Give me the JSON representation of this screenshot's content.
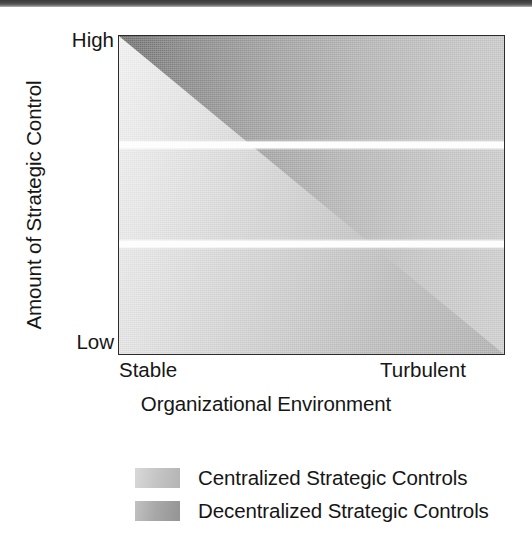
{
  "chart_data": {
    "type": "area",
    "title": "",
    "xlabel": "Organizational Environment",
    "ylabel": "Amount of Strategic Control",
    "x_ticks": [
      "Stable",
      "Turbulent"
    ],
    "y_ticks": [
      "High",
      "Low"
    ],
    "xlim": [
      "Stable",
      "Turbulent"
    ],
    "ylim": [
      "Low",
      "High"
    ],
    "grid": false,
    "legend_position": "bottom",
    "series": [
      {
        "name": "Centralized Strategic Controls",
        "region": "lower-left-triangle",
        "polygon": [
          [
            0,
            1
          ],
          [
            1,
            0
          ],
          [
            0,
            0
          ]
        ],
        "gradient_from": "#f2f2f2",
        "gradient_to": "#b0b0b0",
        "note": "Dominant when environment is Stable and strategic control is High"
      },
      {
        "name": "Decentralized Strategic Controls",
        "region": "upper-right-triangle",
        "polygon": [
          [
            0,
            1
          ],
          [
            1,
            1
          ],
          [
            1,
            0
          ]
        ],
        "gradient_from": "#6e6e6e",
        "gradient_to": "#cfcfcf",
        "note": "Dominant when environment is Turbulent and strategic control is Low"
      }
    ],
    "dividers": [
      {
        "type": "horizontal-white-band",
        "y_fraction": 0.33
      },
      {
        "type": "horizontal-white-band",
        "y_fraction": 0.64
      }
    ],
    "colors": {
      "axis_border": "#2b2b2b",
      "text": "#161616",
      "band_separator": "#fdfdfd",
      "background": "#ffffff"
    }
  },
  "axes": {
    "y_title": "Amount of Strategic Control",
    "y_tick_high": "High",
    "y_tick_low": "Low",
    "x_title": "Organizational Environment",
    "x_tick_left": "Stable",
    "x_tick_right": "Turbulent"
  },
  "legend": {
    "items": [
      {
        "label": "Centralized Strategic Controls",
        "swatch": "light-gray-gradient"
      },
      {
        "label": "Decentralized Strategic Controls",
        "swatch": "medium-gray-gradient"
      }
    ]
  }
}
